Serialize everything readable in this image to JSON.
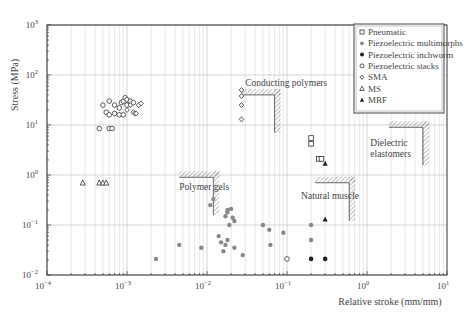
{
  "chart_data": {
    "type": "scatter",
    "title": "",
    "xlabel": "Relative stroke (mm/mm)",
    "ylabel": "Stress (MPa)",
    "xscale": "log",
    "yscale": "log",
    "xlim": [
      0.0001,
      10
    ],
    "ylim": [
      0.01,
      1000
    ],
    "grid": true,
    "legend_position": "upper right",
    "x_ticks": [
      "10^-4",
      "10^-3",
      "10^-2",
      "10^-1",
      "10^0",
      "10^1"
    ],
    "y_ticks": [
      "10^-2",
      "10^-1",
      "10^0",
      "10^1",
      "10^2",
      "10^3"
    ],
    "series": [
      {
        "name": "Pneumatic",
        "marker": "open-square",
        "points": [
          [
            0.2,
            5.5
          ],
          [
            0.2,
            4.2
          ],
          [
            0.25,
            2.1
          ],
          [
            0.27,
            2.1
          ]
        ]
      },
      {
        "name": "Piezoelectric multimorphs",
        "marker": "grey-dot",
        "points": [
          [
            0.0023,
            0.021
          ],
          [
            0.0045,
            0.04
          ],
          [
            0.0085,
            0.035
          ],
          [
            0.011,
            0.25
          ],
          [
            0.012,
            0.33
          ],
          [
            0.014,
            0.06
          ],
          [
            0.015,
            0.045
          ],
          [
            0.016,
            0.03
          ],
          [
            0.017,
            0.15
          ],
          [
            0.018,
            0.2
          ],
          [
            0.018,
            0.18
          ],
          [
            0.019,
            0.1
          ],
          [
            0.02,
            0.21
          ],
          [
            0.021,
            0.14
          ],
          [
            0.022,
            0.12
          ],
          [
            0.018,
            0.05
          ],
          [
            0.017,
            0.04
          ],
          [
            0.022,
            0.035
          ],
          [
            0.028,
            0.025
          ],
          [
            0.05,
            0.1
          ],
          [
            0.06,
            0.08
          ],
          [
            0.062,
            0.04
          ],
          [
            0.09,
            0.07
          ],
          [
            0.2,
            0.1
          ],
          [
            0.2,
            0.05
          ]
        ]
      },
      {
        "name": "Piezoelectric inchworm",
        "marker": "black-dot",
        "points": [
          [
            0.2,
            0.021
          ],
          [
            0.3,
            0.021
          ]
        ]
      },
      {
        "name": "Piezoelectric stacks",
        "marker": "open-circle",
        "points": [
          [
            0.0005,
            25
          ],
          [
            0.0006,
            30
          ],
          [
            0.0007,
            25
          ],
          [
            0.0008,
            22
          ],
          [
            0.00085,
            28
          ],
          [
            0.0009,
            30
          ],
          [
            0.00095,
            35
          ],
          [
            0.001,
            32
          ],
          [
            0.001,
            25
          ],
          [
            0.0011,
            30
          ],
          [
            0.0012,
            28
          ],
          [
            0.00055,
            18
          ],
          [
            0.0006,
            16
          ],
          [
            0.0007,
            17
          ],
          [
            0.0008,
            16
          ],
          [
            0.00045,
            8.5
          ],
          [
            0.0006,
            8.5
          ],
          [
            0.00065,
            8.5
          ],
          [
            0.0009,
            16
          ],
          [
            0.1,
            0.021
          ]
        ]
      },
      {
        "name": "SMA",
        "marker": "open-diamond",
        "points": [
          [
            0.027,
            50
          ],
          [
            0.027,
            38
          ],
          [
            0.027,
            25
          ],
          [
            0.027,
            13
          ],
          [
            0.001,
            20
          ],
          [
            0.0011,
            25
          ],
          [
            0.0012,
            18
          ],
          [
            0.00125,
            17
          ],
          [
            0.0013,
            17
          ],
          [
            0.0014,
            25
          ],
          [
            0.0015,
            27
          ]
        ]
      },
      {
        "name": "MS",
        "marker": "open-triangle",
        "points": [
          [
            0.00028,
            0.7
          ],
          [
            0.00045,
            0.7
          ],
          [
            0.0005,
            0.7
          ],
          [
            0.00055,
            0.7
          ]
        ]
      },
      {
        "name": "MRF",
        "marker": "filled-triangle",
        "points": [
          [
            0.3,
            1.7
          ],
          [
            0.3,
            0.13
          ]
        ]
      }
    ],
    "annotations": [
      {
        "text": "Conducting polymers",
        "x": 0.03,
        "y": 60
      },
      {
        "text": "Polymer gels",
        "x": 0.0045,
        "y": 0.5
      },
      {
        "text": "Natural muscle",
        "x": 0.15,
        "y": 0.33
      },
      {
        "text": "Dielectric elastomers",
        "x": 1.1,
        "y": 3.8
      }
    ],
    "region_boundaries": [
      {
        "label": "Conducting polymers",
        "corner": [
          0.07,
          40
        ],
        "extends": "left-down"
      },
      {
        "label": "Polymer gels",
        "corner": [
          0.012,
          0.9
        ],
        "extends": "left-down"
      },
      {
        "label": "Natural muscle",
        "corner": [
          0.6,
          0.7
        ],
        "extends": "left-down"
      },
      {
        "label": "Dielectric elastomers",
        "corner": [
          5,
          9
        ],
        "extends": "left-down"
      }
    ]
  },
  "legend": {
    "items": [
      {
        "label": "Pneumatic",
        "marker": "open-square"
      },
      {
        "label": "Piezoelectric multimorphs",
        "marker": "grey-dot"
      },
      {
        "label": "Piezoelectric inchworm",
        "marker": "black-dot"
      },
      {
        "label": "Piezoelectric stacks",
        "marker": "open-circle"
      },
      {
        "label": "SMA",
        "marker": "open-diamond"
      },
      {
        "label": "MS",
        "marker": "open-triangle"
      },
      {
        "label": "MRF",
        "marker": "filled-triangle"
      }
    ]
  },
  "axes": {
    "xlabel": "Relative stroke (mm/mm)",
    "ylabel": "Stress (MPa)",
    "x_tick_bases": [
      "10",
      "10",
      "10",
      "10",
      "10",
      "10"
    ],
    "x_tick_exps": [
      "−4",
      "−3",
      "−2",
      "−1",
      "0",
      "1"
    ],
    "y_tick_exps": [
      "−2",
      "−1",
      "0",
      "1",
      "2",
      "3"
    ]
  },
  "colors": {
    "axis": "#333333",
    "grid": "#cccccc",
    "marker_grey": "#888888",
    "marker_black": "#222222",
    "hatch": "#555555"
  }
}
